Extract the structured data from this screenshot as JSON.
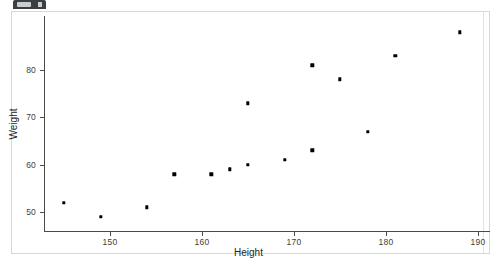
{
  "window": {
    "tab_icon": "window-tab-icon"
  },
  "chart_data": {
    "type": "scatter",
    "title": "",
    "xlabel": "Height",
    "ylabel": "Weight",
    "xlim": [
      144,
      190.5
    ],
    "ylim": [
      47.5,
      90
    ],
    "xticks": [
      150,
      160,
      170,
      180,
      190
    ],
    "yticks": [
      50,
      60,
      70,
      80
    ],
    "xtick_labels": [
      "150",
      "160",
      "170",
      "180",
      "190"
    ],
    "ytick_labels": [
      "50",
      "60",
      "70",
      "80"
    ],
    "grid": false,
    "legend": false,
    "marker": "square",
    "marker_color": "#000000",
    "points": [
      {
        "x": 145,
        "y": 52
      },
      {
        "x": 149,
        "y": 49
      },
      {
        "x": 154,
        "y": 51
      },
      {
        "x": 157,
        "y": 58
      },
      {
        "x": 161,
        "y": 58
      },
      {
        "x": 163,
        "y": 59
      },
      {
        "x": 165,
        "y": 60
      },
      {
        "x": 165,
        "y": 73
      },
      {
        "x": 169,
        "y": 61
      },
      {
        "x": 172,
        "y": 63
      },
      {
        "x": 172,
        "y": 81
      },
      {
        "x": 175,
        "y": 78
      },
      {
        "x": 178,
        "y": 67
      },
      {
        "x": 181,
        "y": 83
      },
      {
        "x": 188,
        "y": 88
      }
    ]
  },
  "colors": {
    "background": "#ffffff",
    "axis": "#4a4a4a",
    "text": "#1f1f1f",
    "panel_border": "#d7d7d7",
    "marker": "#000000"
  }
}
